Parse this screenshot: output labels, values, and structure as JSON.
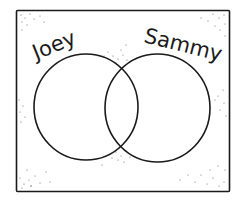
{
  "diagram": {
    "type": "venn",
    "sets": [
      {
        "id": "joey",
        "label": "Joey"
      },
      {
        "id": "sammy",
        "label": "Sammy"
      }
    ],
    "colors": {
      "stroke": "#1a1a1a",
      "background": "#ffffff",
      "speckle": "#555555"
    }
  }
}
